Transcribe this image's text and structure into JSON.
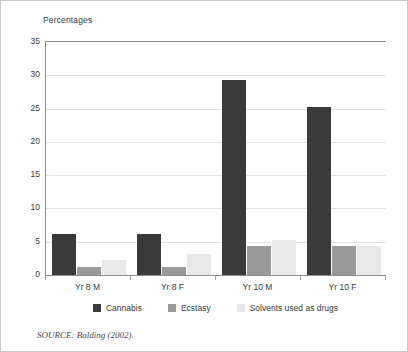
{
  "chart_data": {
    "type": "bar",
    "title": "",
    "subtitle": "",
    "xlabel": "",
    "ylabel": "Percentages",
    "ylim": [
      0,
      35
    ],
    "yticks": [
      0,
      5,
      10,
      15,
      20,
      25,
      30,
      35
    ],
    "grid": true,
    "legend_position": "bottom",
    "categories": [
      "Yr 8 M",
      "Yr 8 F",
      "Yr 10 M",
      "Yr 10 F"
    ],
    "series": [
      {
        "name": "Cannabis",
        "color": "#3a3a3a",
        "values": [
          6.1,
          6.2,
          29.3,
          25.3
        ]
      },
      {
        "name": "Ecstasy",
        "color": "#9a9a9a",
        "values": [
          1.2,
          1.2,
          4.3,
          4.4
        ]
      },
      {
        "name": "Solvents used as drugs",
        "color": "#e8e8e8",
        "values": [
          2.2,
          3.2,
          5.3,
          4.4
        ]
      }
    ],
    "source_note": "SOURCE:  Balding (2002)."
  }
}
